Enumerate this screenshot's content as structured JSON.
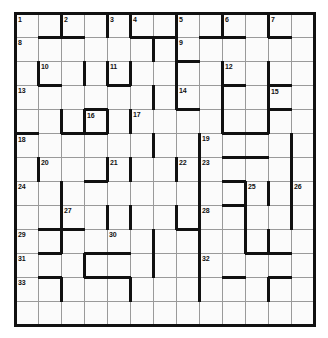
{
  "puzzle": {
    "kind": "barred-crossword-grid",
    "title": "Crossword Grid",
    "columns": 13,
    "rows": 13,
    "cell_width_px": 23,
    "cell_height_px": 24,
    "colors": {
      "cell_fill": "#fbfbfb",
      "thin_rule": "#9a9a9a",
      "bar": "#111111",
      "border": "#111111",
      "number_text": "#111111",
      "page_background": "#ffffff"
    },
    "highest_number": 33,
    "numbers": [
      {
        "n": 1,
        "row": 1,
        "col": 1
      },
      {
        "n": 2,
        "row": 1,
        "col": 3
      },
      {
        "n": 3,
        "row": 1,
        "col": 5
      },
      {
        "n": 4,
        "row": 1,
        "col": 6
      },
      {
        "n": 5,
        "row": 1,
        "col": 8
      },
      {
        "n": 6,
        "row": 1,
        "col": 10
      },
      {
        "n": 7,
        "row": 1,
        "col": 12
      },
      {
        "n": 8,
        "row": 2,
        "col": 1
      },
      {
        "n": 9,
        "row": 2,
        "col": 8
      },
      {
        "n": 10,
        "row": 3,
        "col": 2
      },
      {
        "n": 11,
        "row": 3,
        "col": 5
      },
      {
        "n": 12,
        "row": 3,
        "col": 10
      },
      {
        "n": 13,
        "row": 4,
        "col": 1
      },
      {
        "n": 14,
        "row": 4,
        "col": 8
      },
      {
        "n": 15,
        "row": 4,
        "col": 12
      },
      {
        "n": 16,
        "row": 5,
        "col": 4
      },
      {
        "n": 17,
        "row": 5,
        "col": 6
      },
      {
        "n": 18,
        "row": 6,
        "col": 1
      },
      {
        "n": 19,
        "row": 6,
        "col": 9
      },
      {
        "n": 20,
        "row": 7,
        "col": 2
      },
      {
        "n": 21,
        "row": 7,
        "col": 5
      },
      {
        "n": 22,
        "row": 7,
        "col": 8
      },
      {
        "n": 23,
        "row": 7,
        "col": 9
      },
      {
        "n": 24,
        "row": 8,
        "col": 1
      },
      {
        "n": 25,
        "row": 8,
        "col": 11
      },
      {
        "n": 26,
        "row": 8,
        "col": 13
      },
      {
        "n": 27,
        "row": 9,
        "col": 3
      },
      {
        "n": 28,
        "row": 9,
        "col": 9
      },
      {
        "n": 29,
        "row": 10,
        "col": 1
      },
      {
        "n": 30,
        "row": 10,
        "col": 5
      },
      {
        "n": 31,
        "row": 11,
        "col": 1
      },
      {
        "n": 32,
        "row": 11,
        "col": 9
      },
      {
        "n": 33,
        "row": 12,
        "col": 1
      }
    ],
    "bars_right": [
      {
        "row": 1,
        "col": 2
      },
      {
        "row": 1,
        "col": 4
      },
      {
        "row": 1,
        "col": 5
      },
      {
        "row": 1,
        "col": 7
      },
      {
        "row": 1,
        "col": 9
      },
      {
        "row": 1,
        "col": 11
      },
      {
        "row": 2,
        "col": 6
      },
      {
        "row": 2,
        "col": 7
      },
      {
        "row": 3,
        "col": 1
      },
      {
        "row": 3,
        "col": 3
      },
      {
        "row": 3,
        "col": 4
      },
      {
        "row": 3,
        "col": 5
      },
      {
        "row": 3,
        "col": 7
      },
      {
        "row": 3,
        "col": 9
      },
      {
        "row": 3,
        "col": 11
      },
      {
        "row": 4,
        "col": 6
      },
      {
        "row": 4,
        "col": 7
      },
      {
        "row": 4,
        "col": 9
      },
      {
        "row": 4,
        "col": 11
      },
      {
        "row": 5,
        "col": 2
      },
      {
        "row": 5,
        "col": 3
      },
      {
        "row": 5,
        "col": 4
      },
      {
        "row": 5,
        "col": 5
      },
      {
        "row": 5,
        "col": 9
      },
      {
        "row": 5,
        "col": 11
      },
      {
        "row": 6,
        "col": 6
      },
      {
        "row": 6,
        "col": 8
      },
      {
        "row": 6,
        "col": 12
      },
      {
        "row": 7,
        "col": 1
      },
      {
        "row": 7,
        "col": 4
      },
      {
        "row": 7,
        "col": 5
      },
      {
        "row": 7,
        "col": 7
      },
      {
        "row": 7,
        "col": 8
      },
      {
        "row": 7,
        "col": 12
      },
      {
        "row": 8,
        "col": 2
      },
      {
        "row": 8,
        "col": 8
      },
      {
        "row": 8,
        "col": 10
      },
      {
        "row": 8,
        "col": 11
      },
      {
        "row": 8,
        "col": 12
      },
      {
        "row": 9,
        "col": 2
      },
      {
        "row": 9,
        "col": 4
      },
      {
        "row": 9,
        "col": 5
      },
      {
        "row": 9,
        "col": 7
      },
      {
        "row": 9,
        "col": 8
      },
      {
        "row": 9,
        "col": 10
      },
      {
        "row": 9,
        "col": 12
      },
      {
        "row": 10,
        "col": 2
      },
      {
        "row": 10,
        "col": 6
      },
      {
        "row": 10,
        "col": 8
      },
      {
        "row": 10,
        "col": 10
      },
      {
        "row": 10,
        "col": 11
      },
      {
        "row": 11,
        "col": 3
      },
      {
        "row": 11,
        "col": 6
      },
      {
        "row": 11,
        "col": 8
      },
      {
        "row": 12,
        "col": 2
      },
      {
        "row": 12,
        "col": 5
      },
      {
        "row": 12,
        "col": 8
      },
      {
        "row": 12,
        "col": 11
      }
    ],
    "bars_bottom": [
      {
        "row": 1,
        "col": 2
      },
      {
        "row": 1,
        "col": 3
      },
      {
        "row": 1,
        "col": 6
      },
      {
        "row": 1,
        "col": 7
      },
      {
        "row": 1,
        "col": 9
      },
      {
        "row": 1,
        "col": 10
      },
      {
        "row": 1,
        "col": 12
      },
      {
        "row": 2,
        "col": 8
      },
      {
        "row": 3,
        "col": 2
      },
      {
        "row": 3,
        "col": 5
      },
      {
        "row": 3,
        "col": 10
      },
      {
        "row": 3,
        "col": 12
      },
      {
        "row": 4,
        "col": 4
      },
      {
        "row": 4,
        "col": 8
      },
      {
        "row": 4,
        "col": 12
      },
      {
        "row": 5,
        "col": 1
      },
      {
        "row": 5,
        "col": 3
      },
      {
        "row": 5,
        "col": 4
      },
      {
        "row": 5,
        "col": 10
      },
      {
        "row": 5,
        "col": 11
      },
      {
        "row": 6,
        "col": 10
      },
      {
        "row": 6,
        "col": 11
      },
      {
        "row": 7,
        "col": 4
      },
      {
        "row": 7,
        "col": 10
      },
      {
        "row": 8,
        "col": 10
      },
      {
        "row": 9,
        "col": 2
      },
      {
        "row": 9,
        "col": 3
      },
      {
        "row": 9,
        "col": 8
      },
      {
        "row": 10,
        "col": 2
      },
      {
        "row": 10,
        "col": 4
      },
      {
        "row": 10,
        "col": 5
      },
      {
        "row": 10,
        "col": 11
      },
      {
        "row": 10,
        "col": 12
      },
      {
        "row": 11,
        "col": 2
      },
      {
        "row": 11,
        "col": 4
      },
      {
        "row": 11,
        "col": 5
      },
      {
        "row": 11,
        "col": 10
      },
      {
        "row": 11,
        "col": 12
      }
    ]
  }
}
